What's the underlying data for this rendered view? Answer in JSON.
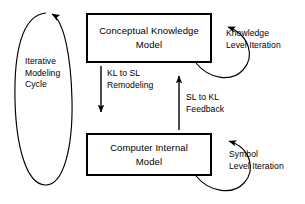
{
  "diagram": {
    "type": "flow-diagram",
    "background_color": "#ffffff",
    "stroke_color": "#000000",
    "boxes": [
      {
        "id": "conceptual-knowledge-model",
        "line1": "Conceptual Knowledge",
        "line2": "Model",
        "text": "Conceptual Knowledge Model"
      },
      {
        "id": "computer-internal-model",
        "line1": "Computer Internal",
        "line2": "Model",
        "text": "Computer Internal Model"
      }
    ],
    "labels": {
      "iterative_cycle": "Iterative\nModeling\nCycle",
      "kl_to_sl": "KL to SL\nRemodeling",
      "sl_to_kl": "SL to KL\nFeedback",
      "knowledge_level_iteration": "Knowledge\nLevel Iteration",
      "symbol_level_iteration": "Symbol\nLevel Iteration"
    },
    "arrows": [
      {
        "id": "kl-to-sl-arrow",
        "from": "conceptual-knowledge-model",
        "to": "computer-internal-model",
        "direction": "down",
        "label": "KL to SL Remodeling"
      },
      {
        "id": "sl-to-kl-arrow",
        "from": "computer-internal-model",
        "to": "conceptual-knowledge-model",
        "direction": "up",
        "label": "SL to KL Feedback"
      },
      {
        "id": "knowledge-level-iteration-loop",
        "from": "conceptual-knowledge-model",
        "to": "conceptual-knowledge-model",
        "direction": "self-loop-right",
        "label": "Knowledge Level Iteration"
      },
      {
        "id": "symbol-level-iteration-loop",
        "from": "computer-internal-model",
        "to": "computer-internal-model",
        "direction": "self-loop-right",
        "label": "Symbol Level Iteration"
      },
      {
        "id": "iterative-modeling-cycle-loop",
        "from": "computer-internal-model",
        "to": "conceptual-knowledge-model",
        "direction": "ellipse-clockwise-left",
        "label": "Iterative Modeling Cycle"
      }
    ]
  }
}
